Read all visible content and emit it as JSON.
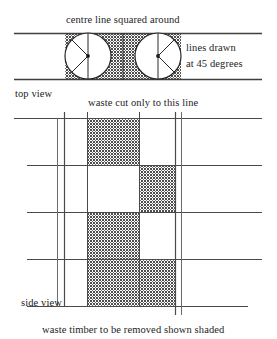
{
  "diagram": {
    "labels": {
      "centre_line": "centre line squared around",
      "lines_drawn": "lines drawn",
      "at_45_degrees": "at 45 degrees",
      "top_view": "top view",
      "waste_cut": "waste cut only to this line",
      "side_view": "side view",
      "waste_timber": "waste timber to be removed shown shaded"
    },
    "colors": {
      "ink": "#1d1d1d",
      "line": "#4a4a4a",
      "shading": "#585858",
      "paper": "#ffffff"
    },
    "top_view": {
      "band": {
        "x": 14,
        "y": 33,
        "width": 248,
        "height": 47
      },
      "circles": [
        {
          "cx": 88,
          "cy": 56,
          "r": 23,
          "diagonal_direction": "left"
        },
        {
          "cx": 158,
          "cy": 56,
          "r": 23,
          "diagonal_direction": "right"
        }
      ],
      "centre_lines_x": [
        88,
        158
      ],
      "waste_cut_line_x": 123,
      "diagonal_angle_degrees": 45
    },
    "side_view": {
      "grid": {
        "columns_x": [
          57,
          64,
          87,
          139,
          175,
          181
        ],
        "rows_y": [
          118,
          165,
          212,
          259,
          306
        ],
        "left_extent": 14,
        "right_extent": 262
      },
      "cells": {
        "col_left_x": 64,
        "col_mid_x": 87,
        "col_right_x": 139,
        "col_end_x": 175
      },
      "shaded_blocks": [
        {
          "x": 87,
          "y": 118,
          "width": 52,
          "height": 47
        },
        {
          "x": 139,
          "y": 165,
          "width": 36,
          "height": 47
        },
        {
          "x": 87,
          "y": 212,
          "width": 52,
          "height": 47
        },
        {
          "x": 139,
          "y": 259,
          "width": 36,
          "height": 47
        },
        {
          "x": 87,
          "y": 259,
          "width": 52,
          "height": 47
        }
      ]
    }
  }
}
